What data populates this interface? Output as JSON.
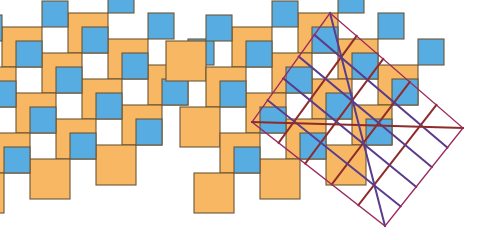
{
  "figure": {
    "title": "Pythagorean two-squares tiling with lattice overlay",
    "canvas": {
      "width": 480,
      "height": 240,
      "background": "#ffffff"
    }
  },
  "colors": {
    "large_square_fill": "#f8b863",
    "small_square_fill": "#57ade2",
    "square_stroke": "#6b5536",
    "diagonal_up_line": "#8e2b2b",
    "diagonal_down_line": "#5a3c8c",
    "boundary_line": "#9b2a5e"
  },
  "geometry": {
    "large_square_size": 40,
    "small_square_size": 26,
    "stroke_width": 1.1,
    "lattice_vector_a": {
      "dx": 40,
      "dy": 26
    },
    "lattice_vector_b": {
      "dx": -26,
      "dy": 40
    },
    "left_panel_origin": {
      "x": 68,
      "y": 13
    },
    "right_panel_origin": {
      "x": 298,
      "y": 13
    },
    "cell_indices": [
      {
        "i": 0,
        "j": 0
      },
      {
        "i": 1,
        "j": 0
      },
      {
        "i": 2,
        "j": 0
      },
      {
        "i": -1,
        "j": 1
      },
      {
        "i": 0,
        "j": 1
      },
      {
        "i": 1,
        "j": 1
      },
      {
        "i": 2,
        "j": 1
      },
      {
        "i": -2,
        "j": 2
      },
      {
        "i": -1,
        "j": 2
      },
      {
        "i": 0,
        "j": 2
      },
      {
        "i": 1,
        "j": 2
      },
      {
        "i": 2,
        "j": 2
      },
      {
        "i": -1,
        "j": 3
      },
      {
        "i": 0,
        "j": 3
      },
      {
        "i": 1,
        "j": 3
      },
      {
        "i": 0,
        "j": 4
      }
    ]
  },
  "overlay": {
    "diagonal_up_count": 5,
    "diagonal_down_count": 5,
    "boundary_polygon": [
      {
        "x": 330,
        "y": 13
      },
      {
        "x": 463,
        "y": 128
      },
      {
        "x": 385,
        "y": 226
      },
      {
        "x": 252,
        "y": 122
      }
    ],
    "boundary_stroke_width": 1.3,
    "diagonal_stroke_width": 2.0
  },
  "panels": [
    {
      "name": "plain-tiling",
      "label": "Pythagorean tiling"
    },
    {
      "name": "overlaid-tiling",
      "label": "Tiling with lattice diagonals and square boundary"
    }
  ]
}
